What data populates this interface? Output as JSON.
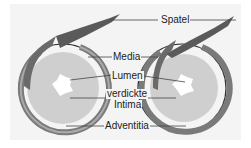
{
  "diagram": {
    "labels": {
      "spatel": "Spatel",
      "media": "Media",
      "lumen": "Lumen",
      "intima_line1": "verdickte",
      "intima_line2": "Intima",
      "adventitia": "Adventitia"
    },
    "colors": {
      "background": "#f4f4f4",
      "intima": "#cfcfcf",
      "media": "#8a8a8a",
      "adventitia": "#555555",
      "lumen": "#ffffff",
      "spatel": "#6a6a6a"
    }
  }
}
